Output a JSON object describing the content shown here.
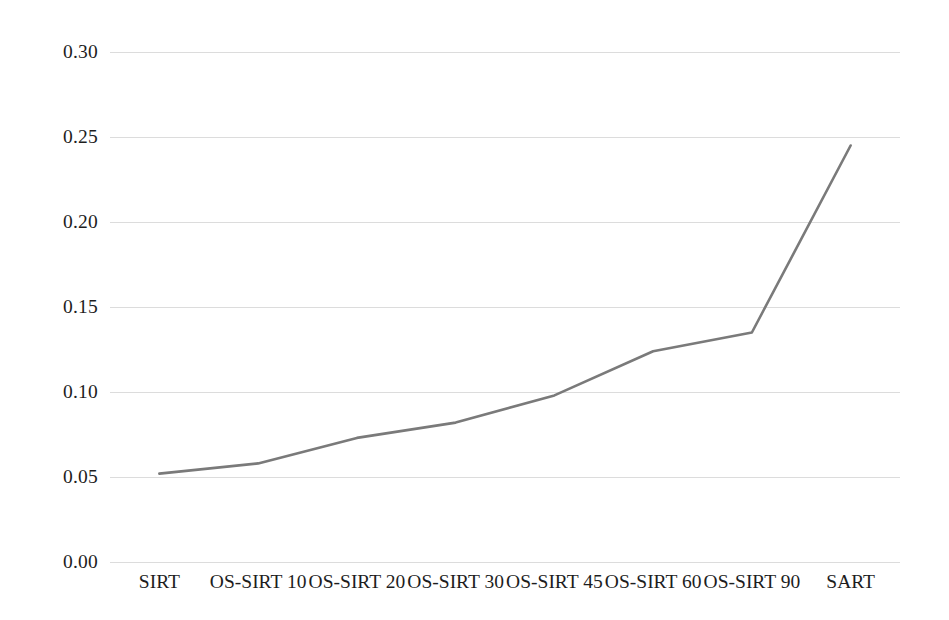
{
  "chart_data": {
    "type": "line",
    "title": "",
    "subtitle": "",
    "xlabel": "",
    "ylabel": "",
    "categories": [
      "SIRT",
      "OS-SIRT 10",
      "OS-SIRT 20",
      "OS-SIRT 30",
      "OS-SIRT 45",
      "OS-SIRT 60",
      "OS-SIRT 90",
      "SART"
    ],
    "values": [
      0.052,
      0.058,
      0.073,
      0.082,
      0.098,
      0.124,
      0.135,
      0.245
    ],
    "series": [
      {
        "name": "",
        "values": [
          0.052,
          0.058,
          0.073,
          0.082,
          0.098,
          0.124,
          0.135,
          0.245
        ],
        "color": "#7a7a7a"
      }
    ],
    "ylim": [
      0.0,
      0.3
    ],
    "ytick_labels": [
      "0.00",
      "0.05",
      "0.10",
      "0.15",
      "0.20",
      "0.25",
      "0.30"
    ],
    "ytick_values": [
      0.0,
      0.05,
      0.1,
      0.15,
      0.2,
      0.25,
      0.3
    ],
    "grid": true,
    "grid_axis": "y",
    "grid_color": "#dcdcdc",
    "legend": false,
    "legend_position": "none",
    "markers": false,
    "line_width": 2.6,
    "background": "#ffffff"
  },
  "axes": {
    "y": {
      "ticks": [
        {
          "label": "0.30",
          "value": 0.3
        },
        {
          "label": "0.25",
          "value": 0.25
        },
        {
          "label": "0.20",
          "value": 0.2
        },
        {
          "label": "0.15",
          "value": 0.15
        },
        {
          "label": "0.10",
          "value": 0.1
        },
        {
          "label": "0.05",
          "value": 0.05
        },
        {
          "label": "0.00",
          "value": 0.0
        }
      ]
    },
    "x": {
      "ticks": [
        {
          "label": "SIRT"
        },
        {
          "label": "OS-SIRT 10"
        },
        {
          "label": "OS-SIRT 20"
        },
        {
          "label": "OS-SIRT 30"
        },
        {
          "label": "OS-SIRT 45"
        },
        {
          "label": "OS-SIRT 60"
        },
        {
          "label": "OS-SIRT 90"
        },
        {
          "label": "SART"
        }
      ]
    }
  }
}
